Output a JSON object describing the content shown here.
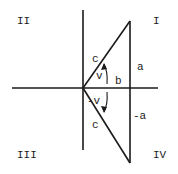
{
  "diagram": {
    "type": "quadrant-triangle",
    "quadrants": {
      "q1": "I",
      "q2": "II",
      "q3": "III",
      "q4": "IV"
    },
    "labels": {
      "hyp_top": "c",
      "hyp_bottom": "c",
      "angle_pos": "v",
      "angle_neg": "-v",
      "adjacent": "b",
      "opposite_pos": "a",
      "opposite_neg": "-a"
    },
    "colors": {
      "ink": "#1a1a1a",
      "background": "#ffffff"
    }
  }
}
